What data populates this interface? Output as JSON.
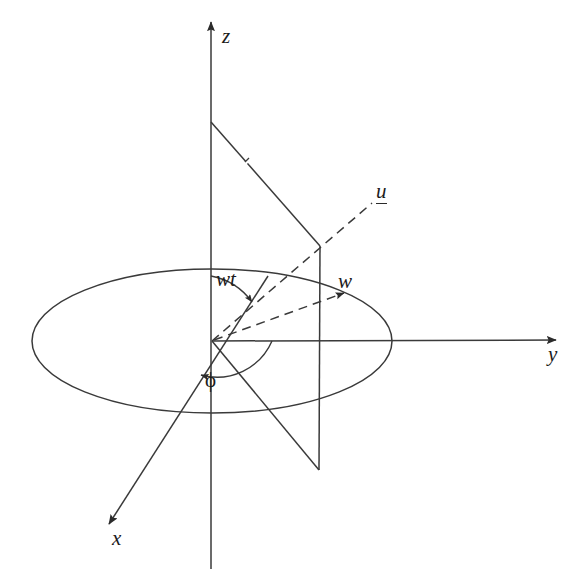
{
  "figure": {
    "background_color": "#ffffff",
    "stroke_color": "#3a3a3a",
    "text_color": "#1c1c1c"
  },
  "axes": [
    {
      "name": "z-axis",
      "label": "z",
      "direction": "up",
      "label_x": 222,
      "label_y": 28
    },
    {
      "name": "y-axis",
      "label": "y",
      "direction": "right",
      "label_x": 548,
      "label_y": 345
    },
    {
      "name": "x-axis",
      "label": "x",
      "direction": "down-left",
      "label_x": 112,
      "label_y": 530
    }
  ],
  "origin": {
    "x": 212,
    "y": 341
  },
  "ellipse": {
    "cx": 212,
    "cy": 341,
    "rx": 180,
    "ry": 72
  },
  "vectors": [
    {
      "name": "w-vector",
      "label": "w",
      "style": "dashed",
      "label_x": 338,
      "label_y": 272,
      "from": {
        "x": 212,
        "y": 341
      },
      "to": {
        "x": 345,
        "y": 294
      }
    },
    {
      "name": "u-vector",
      "label": "u",
      "style": "dashed",
      "underlined": true,
      "label_x": 376,
      "label_y": 182,
      "from": {
        "x": 212,
        "y": 341
      },
      "to": {
        "x": 372,
        "y": 204
      }
    }
  ],
  "angles": [
    {
      "name": "wt-angle",
      "label": "wt",
      "label_x": 216,
      "label_y": 270,
      "description": "angle measured from the z axis to the w vector"
    },
    {
      "name": "phi-angle",
      "label": "ϕ",
      "label_x": 206,
      "label_y": 371,
      "upright": true,
      "description": "azimuthal angle measured from the y axis toward the x axis"
    }
  ],
  "construction_lines": [
    {
      "name": "z-to-apex-line",
      "from": {
        "x": 211,
        "y": 122
      },
      "to": {
        "x": 320,
        "y": 246
      }
    },
    {
      "name": "vertical-drop-line",
      "from": {
        "x": 320,
        "y": 246
      },
      "to": {
        "x": 319,
        "y": 470
      }
    },
    {
      "name": "origin-to-base-line",
      "from": {
        "x": 212,
        "y": 341
      },
      "to": {
        "x": 319,
        "y": 470
      }
    },
    {
      "name": "tick-mark",
      "from": {
        "x": 243,
        "y": 166
      },
      "to": {
        "x": 250,
        "y": 158
      }
    }
  ]
}
